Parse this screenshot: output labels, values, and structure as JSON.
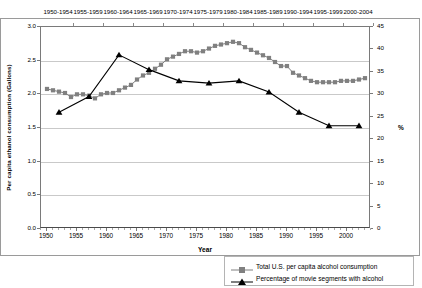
{
  "chart_data": {
    "type": "line",
    "title": "",
    "xlabel": "Year",
    "ylabel": "Per capita ethanol consumption (Gallons)",
    "y2label": "%",
    "grid": true,
    "legend_position": "bottom-right",
    "xlim": [
      1949,
      2004
    ],
    "ylim": [
      0.0,
      3.0
    ],
    "y2lim": [
      0,
      45
    ],
    "xticks": [
      "1950",
      "1955",
      "1960",
      "1965",
      "1970",
      "1975",
      "1980",
      "1985",
      "1990",
      "1995",
      "2000"
    ],
    "yticks": [
      "0.0",
      "0.5",
      "1.0",
      "1.5",
      "2.0",
      "2.5",
      "3.0"
    ],
    "y2ticks": [
      "0",
      "5",
      "10",
      "15",
      "20",
      "25",
      "30",
      "35",
      "40",
      "45"
    ],
    "top_axis_label": "Five-year periods",
    "top_axis_ticks": [
      "1950-1954",
      "1955-1959",
      "1960-1964",
      "1965-1969",
      "1970-1974",
      "1975-1979",
      "1980-1984",
      "1985-1989",
      "1990-1994",
      "1995-1999",
      "2000-2004"
    ],
    "series": [
      {
        "name": "Total U.S. per capita alcohol consumption",
        "axis": "left",
        "unit": "gallons of ethanol",
        "marker": "square",
        "color": "#808080",
        "x": [
          1950,
          1951,
          1952,
          1953,
          1954,
          1955,
          1956,
          1957,
          1958,
          1959,
          1960,
          1961,
          1962,
          1963,
          1964,
          1965,
          1966,
          1967,
          1968,
          1969,
          1970,
          1971,
          1972,
          1973,
          1974,
          1975,
          1976,
          1977,
          1978,
          1979,
          1980,
          1981,
          1982,
          1983,
          1984,
          1985,
          1986,
          1987,
          1988,
          1989,
          1990,
          1991,
          1992,
          1993,
          1994,
          1995,
          1996,
          1997,
          1998,
          1999,
          2000,
          2001,
          2002,
          2003
        ],
        "y": [
          2.08,
          2.06,
          2.04,
          2.02,
          1.96,
          2.0,
          2.0,
          1.98,
          1.94,
          2.0,
          2.02,
          2.02,
          2.06,
          2.1,
          2.14,
          2.22,
          2.28,
          2.32,
          2.38,
          2.44,
          2.52,
          2.56,
          2.6,
          2.64,
          2.64,
          2.62,
          2.64,
          2.68,
          2.72,
          2.74,
          2.76,
          2.78,
          2.76,
          2.7,
          2.66,
          2.62,
          2.58,
          2.54,
          2.48,
          2.42,
          2.42,
          2.32,
          2.28,
          2.24,
          2.2,
          2.18,
          2.18,
          2.18,
          2.18,
          2.2,
          2.2,
          2.2,
          2.22,
          2.24
        ]
      },
      {
        "name": "Percentage of movie segments with alcohol",
        "axis": "right",
        "unit": "percent",
        "marker": "triangle",
        "color": "#000000",
        "x": [
          1952,
          1957,
          1962,
          1967,
          1972,
          1977,
          1982,
          1987,
          1992,
          1997,
          2002
        ],
        "y": [
          26.0,
          29.5,
          38.8,
          35.5,
          33.0,
          32.5,
          33.0,
          30.5,
          26.0,
          23.0,
          23.0
        ]
      }
    ]
  },
  "legend": {
    "entries": [
      "Total U.S. per capita alcohol consumption",
      "Percentage of movie segments with alcohol"
    ]
  }
}
